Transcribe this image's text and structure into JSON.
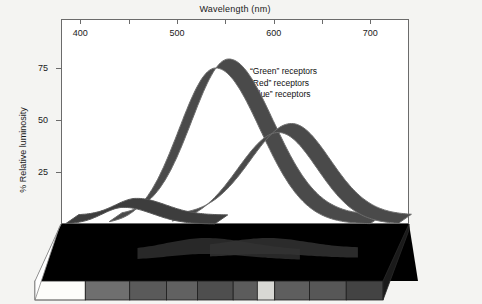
{
  "chart_data": {
    "type": "line",
    "title": "",
    "xlabel": "Wavelength (nm)",
    "ylabel": "% Relative luminosity",
    "xlim": [
      380,
      740
    ],
    "ylim": [
      0,
      88
    ],
    "xticks": [
      400,
      450,
      500,
      550,
      600,
      650,
      700
    ],
    "xtick_labels": [
      "400",
      "",
      "500",
      "",
      "600",
      "",
      "700"
    ],
    "yticks": [
      25,
      50,
      75
    ],
    "ytick_labels": [
      "25",
      "50",
      "75"
    ],
    "grid": false,
    "legend_position": "upper-right-inside",
    "legend": [
      "“Green” receptors",
      "“Red” receptors",
      "“Blue” receptors"
    ],
    "series": [
      {
        "name": "“Green” receptors",
        "peak_wavelength": 540,
        "peak_value": 75,
        "x": [
          440,
          460,
          475,
          490,
          500,
          510,
          520,
          530,
          540,
          550,
          560,
          575,
          590,
          605,
          620,
          640,
          660,
          680
        ],
        "values": [
          2,
          8,
          18,
          33,
          44,
          55,
          64,
          71,
          75,
          74,
          69,
          57,
          42,
          28,
          17,
          8,
          3,
          1
        ]
      },
      {
        "name": "“Red” receptors",
        "peak_wavelength": 605,
        "peak_value": 44,
        "x": [
          500,
          520,
          540,
          555,
          570,
          580,
          590,
          600,
          605,
          615,
          625,
          640,
          655,
          670,
          690,
          710
        ],
        "values": [
          1,
          4,
          10,
          17,
          26,
          33,
          39,
          43,
          44,
          42,
          38,
          30,
          21,
          13,
          6,
          2
        ]
      },
      {
        "name": "“Blue” receptors",
        "peak_wavelength": 445,
        "peak_value": 8,
        "x": [
          400,
          415,
          430,
          440,
          445,
          455,
          470,
          485,
          500,
          515,
          530
        ],
        "values": [
          1,
          4,
          7,
          8,
          8,
          7,
          5,
          3,
          2,
          1,
          0
        ]
      }
    ],
    "spectrum_swatches": [
      {
        "label": "white",
        "color": "#fdfdfa",
        "x_start": 380,
        "x_end": 432
      },
      {
        "label": "violet",
        "color": "#6f6f6f",
        "x_start": 432,
        "x_end": 478
      },
      {
        "label": "blue",
        "color": "#5a5a5a",
        "x_start": 478,
        "x_end": 516
      },
      {
        "label": "cyan",
        "color": "#616161",
        "x_start": 516,
        "x_end": 548
      },
      {
        "label": "green",
        "color": "#4e4e4e",
        "x_start": 548,
        "x_end": 585
      },
      {
        "label": "green-yellow",
        "color": "#5c5c5c",
        "x_start": 585,
        "x_end": 610
      },
      {
        "label": "yellow",
        "color": "#d8d8d4",
        "x_start": 610,
        "x_end": 628
      },
      {
        "label": "orange",
        "color": "#5e5e5e",
        "x_start": 628,
        "x_end": 664
      },
      {
        "label": "red",
        "color": "#575757",
        "x_start": 664,
        "x_end": 702
      },
      {
        "label": "deep-red",
        "color": "#434343",
        "x_start": 702,
        "x_end": 740
      }
    ]
  },
  "colors": {
    "page_background": "#f4f4f2",
    "plot_background": "#ffffff",
    "frame": "#6b6b6b",
    "platform": "#000000",
    "ribbon": "#4a4a4a",
    "ribbon_edge": "#6e6e6e",
    "text": "#1a1a1a"
  }
}
